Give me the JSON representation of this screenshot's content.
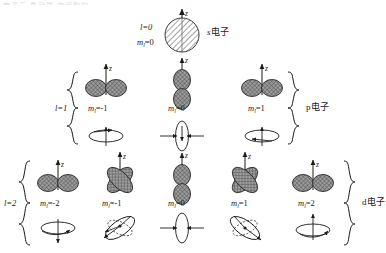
{
  "figure": {
    "title_cutoff_fragment": "电子云 角动量 空间取向",
    "axis_label": "z",
    "rows": [
      {
        "id": "row-s",
        "quantum_l": "l=0",
        "l_value": 0,
        "family_label": "s电子",
        "orbitals": [
          {
            "id": "s-m0",
            "m_label": "m",
            "m_sub": "l",
            "m_value": "=0",
            "shape": "sphere",
            "has_spin_diagram": false
          }
        ]
      },
      {
        "id": "row-p",
        "quantum_l": "l=1",
        "l_value": 1,
        "family_label": "p电子",
        "orbitals": [
          {
            "id": "p-m-1",
            "m_label": "m",
            "m_sub": "l",
            "m_value": "=-1",
            "shape": "dumbbell-horizontal",
            "has_spin_diagram": true,
            "spin": "ellipse-horizontal-ccw"
          },
          {
            "id": "p-m0",
            "m_label": "m",
            "m_sub": "l",
            "m_value": "=0",
            "shape": "dumbbell-vertical",
            "has_spin_diagram": true,
            "spin": "ellipse-vertical-arrows"
          },
          {
            "id": "p-m1",
            "m_label": "m",
            "m_sub": "l",
            "m_value": "=1",
            "shape": "dumbbell-horizontal",
            "has_spin_diagram": true,
            "spin": "ellipse-horizontal-cw"
          }
        ]
      },
      {
        "id": "row-d",
        "quantum_l": "l=2",
        "l_value": 2,
        "family_label": "d电子",
        "orbitals": [
          {
            "id": "d-m-2",
            "m_label": "m",
            "m_sub": "l",
            "m_value": "=-2",
            "shape": "dumbbell-horizontal",
            "has_spin_diagram": true,
            "spin": "ellipse-horizontal-down"
          },
          {
            "id": "d-m-1",
            "m_label": "m",
            "m_sub": "l",
            "m_value": "=-1",
            "shape": "clover-four-lobe",
            "has_spin_diagram": true,
            "spin": "ellipse-tilted-left"
          },
          {
            "id": "d-m0",
            "m_label": "m",
            "m_sub": "l",
            "m_value": "=0",
            "shape": "dumbbell-vertical",
            "has_spin_diagram": true,
            "spin": "ellipse-vertical-arrows"
          },
          {
            "id": "d-m1",
            "m_label": "m",
            "m_sub": "l",
            "m_value": "=1",
            "shape": "clover-four-lobe",
            "has_spin_diagram": true,
            "spin": "ellipse-tilted-right"
          },
          {
            "id": "d-m2",
            "m_label": "m",
            "m_sub": "l",
            "m_value": "=2",
            "shape": "dumbbell-horizontal",
            "has_spin_diagram": true,
            "spin": "ellipse-horizontal-up"
          }
        ]
      }
    ],
    "colors": {
      "stroke": "#1a1a1a",
      "lobe_fill": "#8a8a8a",
      "sphere_fill": "#e8e8e8",
      "background": "#ffffff"
    }
  }
}
